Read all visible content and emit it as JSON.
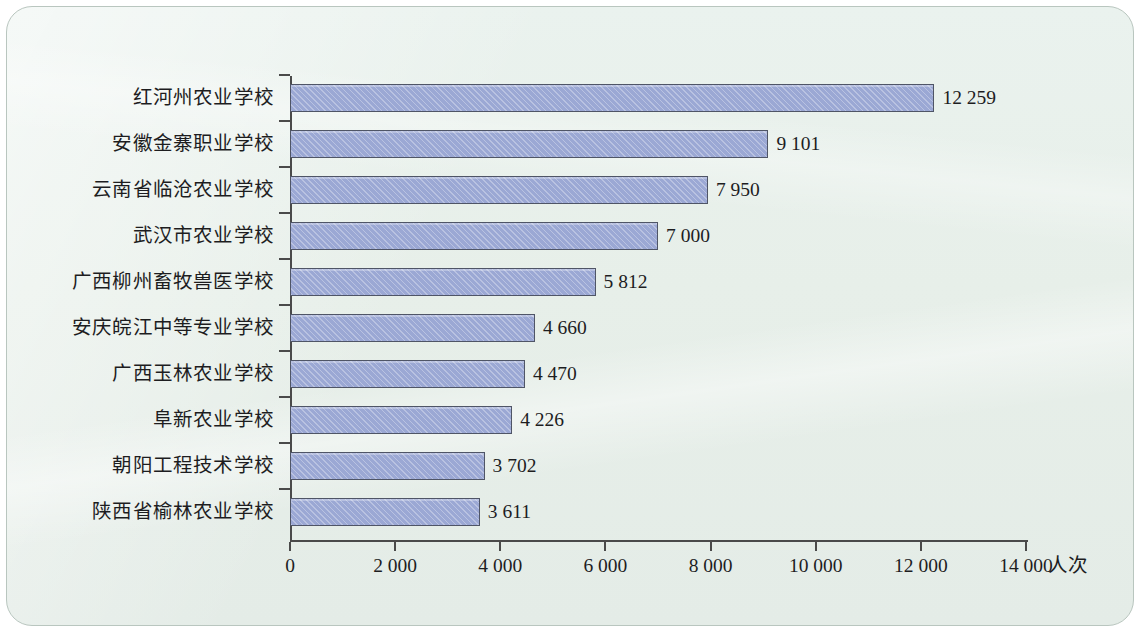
{
  "chart_data": {
    "type": "bar",
    "orientation": "horizontal",
    "title": "",
    "xlabel": "人次",
    "ylabel": "",
    "xlim": [
      0,
      14000
    ],
    "xticks": [
      0,
      2000,
      4000,
      6000,
      8000,
      10000,
      12000,
      14000
    ],
    "xtick_labels": [
      "0",
      "2 000",
      "4 000",
      "6 000",
      "8 000",
      "10 000",
      "12 000",
      "14 000"
    ],
    "grid": false,
    "legend": null,
    "thousands_separator": " ",
    "categories": [
      "红河州农业学校",
      "安徽金寨职业学校",
      "云南省临沧农业学校",
      "武汉市农业学校",
      "广西柳州畜牧兽医学校",
      "安庆皖江中等专业学校",
      "广西玉林农业学校",
      "阜新农业学校",
      "朝阳工程技术学校",
      "陕西省榆林农业学校"
    ],
    "values": [
      12259,
      9101,
      7950,
      7000,
      5812,
      4660,
      4470,
      4226,
      3702,
      3611
    ],
    "value_labels": [
      "12 259",
      "9 101",
      "7 950",
      "7 000",
      "5 812",
      "4 660",
      "4 470",
      "4 226",
      "3 702",
      "3 611"
    ],
    "colors": {
      "bar_fill": "#9ba8d4",
      "bar_border": "#4f5566",
      "axis": "#4a4a4a",
      "text": "#1d1d1f",
      "panel_background": "#e9f0ec",
      "panel_border": "#b9c6bf"
    }
  }
}
